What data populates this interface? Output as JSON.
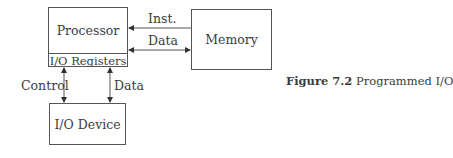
{
  "diagram": {
    "nodes": {
      "processor": {
        "label": "Processor",
        "sub_label": "I/O Registers"
      },
      "memory": {
        "label": "Memory"
      },
      "io_device": {
        "label": "I/O Device"
      }
    },
    "edges": [
      {
        "from": "memory",
        "to": "processor",
        "label": "Inst.",
        "direction": "to-processor"
      },
      {
        "from": "processor",
        "to": "memory",
        "label": "Data",
        "direction": "bidirectional"
      },
      {
        "from": "processor",
        "to": "io_device",
        "label": "Control",
        "direction": "bidirectional"
      },
      {
        "from": "processor",
        "to": "io_device",
        "label": "Data",
        "direction": "bidirectional"
      }
    ]
  },
  "caption": {
    "figure_number": "Figure 7.2",
    "title": "Programmed I/O"
  }
}
